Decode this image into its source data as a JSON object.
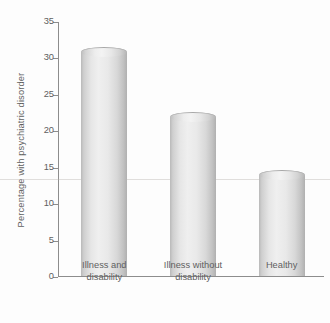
{
  "chart_data": {
    "type": "bar",
    "title": "",
    "xlabel": "",
    "ylabel": "Percentage with psychiatric disorder",
    "categories": [
      "Illness and disability",
      "Illness without disability",
      "Healthy"
    ],
    "category_lines": [
      [
        "Illness and",
        "disability"
      ],
      [
        "Illness without",
        "disability"
      ],
      [
        "Healthy"
      ]
    ],
    "values": [
      30.8,
      21.8,
      13.9
    ],
    "ylim": [
      0,
      35
    ],
    "yticks": [
      0,
      5,
      10,
      15,
      20,
      25,
      30,
      35
    ],
    "ytick_labels": [
      "0",
      "5",
      "10",
      "15",
      "20",
      "25",
      "30",
      "35"
    ],
    "grid": false,
    "legend": null,
    "bar_style": "cylinder",
    "colors": {
      "bar_light": "#efefef",
      "bar_mid": "#d8d8d8",
      "bar_dark": "#b0b0b0",
      "axis": "#8d8d8d",
      "text": "#5f5f5f",
      "background": "#fdfdfd"
    }
  }
}
